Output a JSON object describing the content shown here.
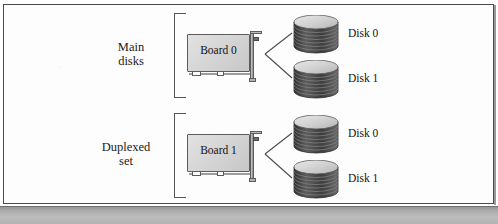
{
  "figure": {
    "type": "disk-duplexing-diagram",
    "frame_border_color": "#4a4a4a",
    "background_color": "#fdfdfd",
    "board_fill_color": "#d6d6d6",
    "disk_fill_color": "#4a4a4a",
    "text_color": "#111111"
  },
  "groups": [
    {
      "id": "main-disks",
      "label_line1": "Main",
      "label_line2": "disks",
      "board": {
        "label": "Board 0"
      },
      "disks": [
        {
          "label": "Disk 0"
        },
        {
          "label": "Disk 1"
        }
      ]
    },
    {
      "id": "duplexed-set",
      "label_line1": "Duplexed",
      "label_line2": "set",
      "board": {
        "label": "Board 1"
      },
      "disks": [
        {
          "label": "Disk 0"
        },
        {
          "label": "Disk 1"
        }
      ]
    }
  ]
}
